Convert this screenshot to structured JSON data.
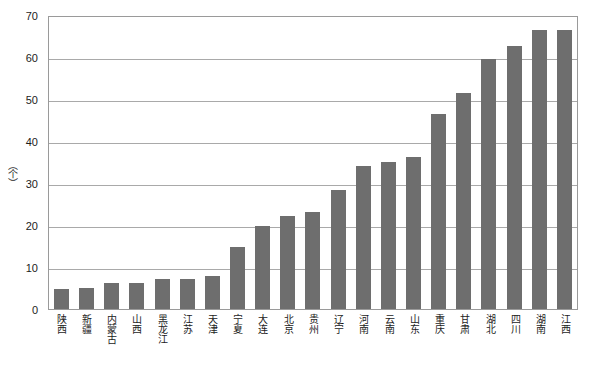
{
  "chart_data": {
    "type": "bar",
    "title": "",
    "subtitle": "",
    "xlabel": "",
    "ylabel": "（个）",
    "ylim": [
      0,
      70
    ],
    "ytick_interval": 10,
    "yticks": [
      70,
      60,
      50,
      40,
      30,
      20,
      10,
      0
    ],
    "grid": true,
    "legend": false,
    "legend_position": "none",
    "orientation": "vertical",
    "bar_color": "#6e6e6e",
    "categories": [
      "陕西",
      "新疆",
      "内蒙古",
      "山西",
      "黑龙江",
      "江苏",
      "天津",
      "宁夏",
      "大连",
      "北京",
      "贵州",
      "辽宁",
      "河南",
      "云南",
      "山东",
      "重庆",
      "甘肃",
      "湖北",
      "四川",
      "湖南",
      "江西"
    ],
    "values": [
      4.8,
      4.9,
      6.3,
      6.2,
      7.1,
      7.2,
      7.8,
      14.7,
      19.8,
      22.2,
      23.0,
      28.4,
      34.0,
      35.0,
      36.3,
      46.5,
      51.5,
      59.5,
      62.6,
      66.4,
      66.4
    ]
  },
  "axes": {
    "y_unit_label": "（个）"
  }
}
